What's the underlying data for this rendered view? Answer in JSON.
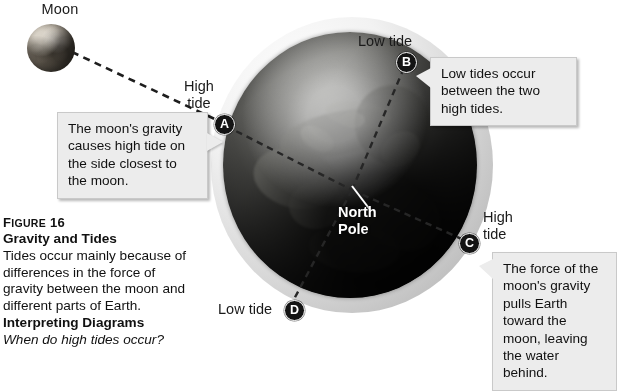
{
  "diagram": {
    "moon": {
      "label": "Moon"
    },
    "earth": {
      "north_pole_label": "North Pole"
    },
    "markers": [
      {
        "id": "A",
        "letter": "A",
        "tide_label": "High\ntide",
        "tide_type": "High tide"
      },
      {
        "id": "B",
        "letter": "B",
        "tide_label": "Low tide",
        "tide_type": "Low tide"
      },
      {
        "id": "C",
        "letter": "C",
        "tide_label": "High\ntide",
        "tide_type": "High tide"
      },
      {
        "id": "D",
        "letter": "D",
        "tide_label": "Low tide",
        "tide_type": "Low tide"
      }
    ],
    "labels": {
      "high_tide_a_line1": "High",
      "high_tide_a_line2": "tide",
      "low_tide_b": "Low tide",
      "high_tide_c_line1": "High",
      "high_tide_c_line2": "tide",
      "low_tide_d": "Low tide"
    },
    "callouts": [
      {
        "id": "moon-gravity",
        "text": "The moon's gravity causes high tide on the side closest to the moon.",
        "points_to": "A"
      },
      {
        "id": "low-tides",
        "text": "Low tides occur between the two high tides.",
        "points_to": "B"
      },
      {
        "id": "force-of-gravity",
        "text": "The force of the moon's gravity pulls Earth toward the moon, leaving the water behind.",
        "points_to": "C"
      }
    ]
  },
  "caption": {
    "figure_word_first": "F",
    "figure_word_rest": "IGURE",
    "figure_number": "16",
    "title": "Gravity and Tides",
    "body": "Tides occur mainly because of differences in the force of gravity between the moon and different parts of Earth.",
    "interpreting_heading": "Interpreting Diagrams",
    "question": "When do high tides occur?"
  },
  "colors": {
    "callout_bg": "#ececec",
    "callout_border": "#c9c9c9",
    "marker_bg": "#141414",
    "marker_text": "#ffffff",
    "text": "#111111",
    "dash_line": "#1d1d1d",
    "north_pole_text": "#ffffff"
  }
}
